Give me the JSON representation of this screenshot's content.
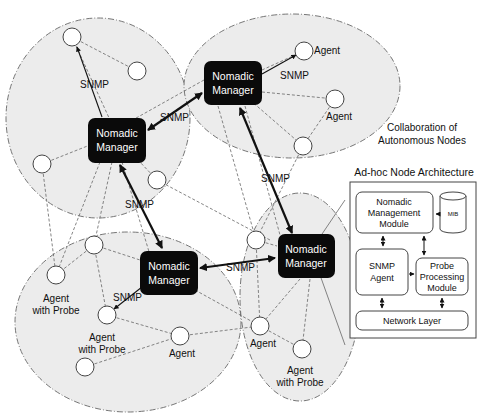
{
  "diagram": {
    "clusters": [
      {
        "id": "cluster-top-left",
        "cx": 98,
        "cy": 118,
        "rx": 92,
        "ry": 100
      },
      {
        "id": "cluster-top-right",
        "cx": 292,
        "cy": 86,
        "rx": 108,
        "ry": 72
      },
      {
        "id": "cluster-bottom-left",
        "cx": 128,
        "cy": 320,
        "rx": 112,
        "ry": 90
      },
      {
        "id": "cluster-bottom-right",
        "cx": 300,
        "cy": 295,
        "rx": 60,
        "ry": 105
      }
    ],
    "managers": [
      {
        "id": "manager-1",
        "x": 88,
        "y": 117,
        "w": 58,
        "h": 46,
        "line1": "Nomadic",
        "line2": "Manager"
      },
      {
        "id": "manager-2",
        "x": 204,
        "y": 62,
        "w": 58,
        "h": 44,
        "line1": "Nomadic",
        "line2": "Manager"
      },
      {
        "id": "manager-3",
        "x": 140,
        "y": 252,
        "w": 58,
        "h": 44,
        "line1": "Nomadic",
        "line2": "Manager"
      },
      {
        "id": "manager-4",
        "x": 277,
        "y": 235,
        "w": 58,
        "h": 44,
        "line1": "Nomadic",
        "line2": "Manager"
      }
    ],
    "nodes": [
      {
        "id": "n1",
        "x": 72,
        "y": 37
      },
      {
        "id": "n2",
        "x": 137,
        "y": 71
      },
      {
        "id": "n3",
        "x": 42,
        "y": 164
      },
      {
        "id": "n4",
        "x": 157,
        "y": 180
      },
      {
        "id": "n5",
        "x": 304,
        "y": 51,
        "label": "Agent"
      },
      {
        "id": "n6",
        "x": 335,
        "y": 99,
        "label": "Agent"
      },
      {
        "id": "n7",
        "x": 303,
        "y": 146
      },
      {
        "id": "n8",
        "x": 94,
        "y": 245
      },
      {
        "id": "n9",
        "x": 56,
        "y": 275,
        "label": "Agent with Probe"
      },
      {
        "id": "n10",
        "x": 107,
        "y": 315,
        "label": "Agent with Probe"
      },
      {
        "id": "n11",
        "x": 180,
        "y": 336,
        "label": "Agent"
      },
      {
        "id": "n12",
        "x": 85,
        "y": 367
      },
      {
        "id": "n13",
        "x": 256,
        "y": 240
      },
      {
        "id": "n14",
        "x": 260,
        "y": 326,
        "label": "Agent"
      },
      {
        "id": "n15",
        "x": 302,
        "y": 349,
        "label": "Agent with Probe"
      }
    ],
    "snmp_labels": [
      {
        "text": "SNMP",
        "x": 78,
        "y": 86
      },
      {
        "text": "SNMP",
        "x": 160,
        "y": 120
      },
      {
        "text": "SNMP",
        "x": 306,
        "y": 79
      },
      {
        "text": "SNMP",
        "x": 125,
        "y": 208
      },
      {
        "text": "SNMP",
        "x": 260,
        "y": 182
      },
      {
        "text": "SNMP",
        "x": 225,
        "y": 270
      },
      {
        "text": "SNMP",
        "x": 112,
        "y": 302
      }
    ],
    "annotation": {
      "line1": "Collaboration of",
      "line2": "Autonomous Nodes"
    },
    "architecture": {
      "title": "Ad-hoc Node Architecture",
      "nomadic_module": {
        "line1": "Nomadic",
        "line2": "Management",
        "line3": "Module"
      },
      "mib": "MIB",
      "snmp_agent": {
        "line1": "SNMP",
        "line2": "Agent"
      },
      "probe_module": {
        "line1": "Probe",
        "line2": "Processing",
        "line3": "Module"
      },
      "network_layer": "Network Layer"
    },
    "agent_label": "Agent",
    "agent_probe_line1": "Agent",
    "agent_probe_line2": "with Probe"
  },
  "colors": {
    "cluster_fill": "#ececec",
    "cluster_stroke": "#666666",
    "manager_fill": "#0a0a0a",
    "manager_text": "#ffffff",
    "line": "#555555"
  }
}
